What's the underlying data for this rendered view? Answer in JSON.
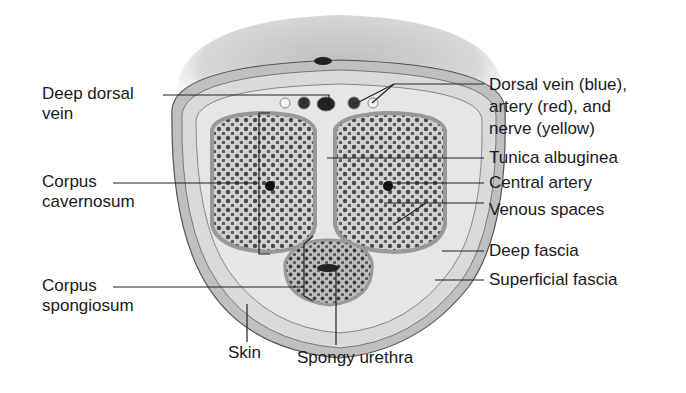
{
  "figure": {
    "colors": {
      "skin": "#c8c8c8",
      "fascia": "#dcdcdc",
      "erectile": "#8a8a8a",
      "line": "#222222",
      "background": "#ffffff"
    }
  },
  "labels_left": [
    {
      "id": "deep-dorsal-vein",
      "line1": "Deep dorsal",
      "line2": "vein"
    },
    {
      "id": "corpus-cavernosum",
      "line1": "Corpus",
      "line2": "cavernosum"
    },
    {
      "id": "corpus-spongiosum",
      "line1": "Corpus",
      "line2": "spongiosum"
    }
  ],
  "labels_right": [
    {
      "id": "dorsal-vessels",
      "line1": "Dorsal vein (blue),",
      "line2": "artery (red), and",
      "line3": "nerve (yellow)"
    },
    {
      "id": "tunica-albuginea",
      "line1": "Tunica albuginea"
    },
    {
      "id": "central-artery",
      "line1": "Central artery"
    },
    {
      "id": "venous-spaces",
      "line1": "Venous spaces"
    },
    {
      "id": "deep-fascia",
      "line1": "Deep fascia"
    },
    {
      "id": "superficial-fascia",
      "line1": "Superficial fascia"
    }
  ],
  "labels_bottom": [
    {
      "id": "skin",
      "line1": "Skin"
    },
    {
      "id": "spongy-urethra",
      "line1": "Spongy urethra"
    }
  ]
}
